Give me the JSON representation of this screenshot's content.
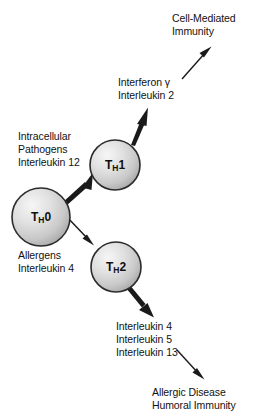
{
  "diagram": {
    "cells": [
      {
        "id": "th0",
        "label_main": "T",
        "label_sub": "H",
        "label_tail": "0",
        "cx": 41,
        "cy": 217,
        "r": 29
      },
      {
        "id": "th1",
        "label_main": "T",
        "label_sub": "H",
        "label_tail": "1",
        "cx": 115,
        "cy": 165,
        "r": 25
      },
      {
        "id": "th2",
        "label_main": "T",
        "label_sub": "H",
        "label_tail": "2",
        "cx": 116,
        "cy": 267,
        "r": 25
      }
    ],
    "labels": {
      "cell_mediated": "Cell-Mediated\nImmunity",
      "th1_cytokines": "Interferon γ\nInterleukin 2",
      "th1_inducers": "Intracellular\nPathogens\nInterleukin 12",
      "th2_inducers": "Allergens\nInterleukin 4",
      "th2_cytokines": "Interleukin 4\nInterleukin 5\nInterleukin 13",
      "allergic_outcome": "Allergic Disease\nHumoral Immunity"
    },
    "colors": {
      "cell_fill_light": "#f2f2f2",
      "cell_fill_mid": "#d4d4d4",
      "cell_fill_dark": "#a8a8a8",
      "cell_stroke": "#2b2b2b",
      "arrow": "#1a1a1a",
      "text": "#121212",
      "background": "#ffffff"
    },
    "arrows": [
      {
        "id": "th0-to-th1",
        "style": "tapered",
        "from": [
          63,
          201
        ],
        "to": [
          91,
          174
        ]
      },
      {
        "id": "th0-to-th2",
        "style": "thin",
        "from": [
          66,
          216
        ],
        "to": [
          93,
          243
        ]
      },
      {
        "id": "th1-to-cytokines",
        "style": "tapered",
        "from": [
          133,
          144
        ],
        "to": [
          147,
          109
        ]
      },
      {
        "id": "cytokines-to-cell-mediated",
        "style": "thin",
        "from": [
          182,
          79
        ],
        "to": [
          211,
          47
        ]
      },
      {
        "id": "th2-to-cytokines",
        "style": "tapered",
        "from": [
          130,
          285
        ],
        "to": [
          153,
          313
        ]
      },
      {
        "id": "cytokines-to-allergic",
        "style": "thin",
        "from": [
          177,
          350
        ],
        "to": [
          204,
          379
        ]
      }
    ]
  }
}
